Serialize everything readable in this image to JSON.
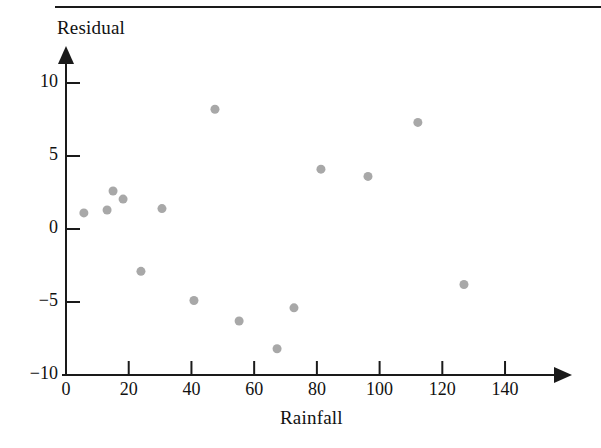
{
  "figure": {
    "type": "scatter-plot",
    "background_color": "#ffffff",
    "axis_color": "#1a1a1a",
    "point_color": "#a8a8a8",
    "top_rule": "horizontal-rule"
  },
  "chart_data": {
    "type": "scatter",
    "title": "",
    "xlabel": "Rainfall",
    "ylabel": "Residual",
    "xlim": [
      0,
      150
    ],
    "ylim": [
      -10,
      11
    ],
    "xticks": [
      0,
      20,
      40,
      60,
      80,
      100,
      120,
      140
    ],
    "yticks": [
      -10,
      -5,
      0,
      5,
      10
    ],
    "xtick_labels": [
      "0",
      "20",
      "40",
      "60",
      "80",
      "100",
      "120",
      "140"
    ],
    "ytick_labels": [
      "−10",
      "−5",
      "0",
      "5",
      "10"
    ],
    "grid": false,
    "legend": null,
    "marker": "filled-circle",
    "marker_color": "#a8a8a8",
    "marker_size": 9,
    "points": [
      {
        "x": 5.7,
        "y": 1.1
      },
      {
        "x": 13.1,
        "y": 1.3
      },
      {
        "x": 15.0,
        "y": 2.6
      },
      {
        "x": 18.2,
        "y": 2.05
      },
      {
        "x": 23.9,
        "y": -2.9
      },
      {
        "x": 30.6,
        "y": 1.4
      },
      {
        "x": 40.8,
        "y": -4.9
      },
      {
        "x": 47.5,
        "y": 8.2
      },
      {
        "x": 55.2,
        "y": -6.3
      },
      {
        "x": 67.3,
        "y": -8.2
      },
      {
        "x": 72.7,
        "y": -5.4
      },
      {
        "x": 81.3,
        "y": 4.1
      },
      {
        "x": 96.3,
        "y": 3.6
      },
      {
        "x": 112.2,
        "y": 7.3
      },
      {
        "x": 126.9,
        "y": -3.8
      }
    ]
  }
}
